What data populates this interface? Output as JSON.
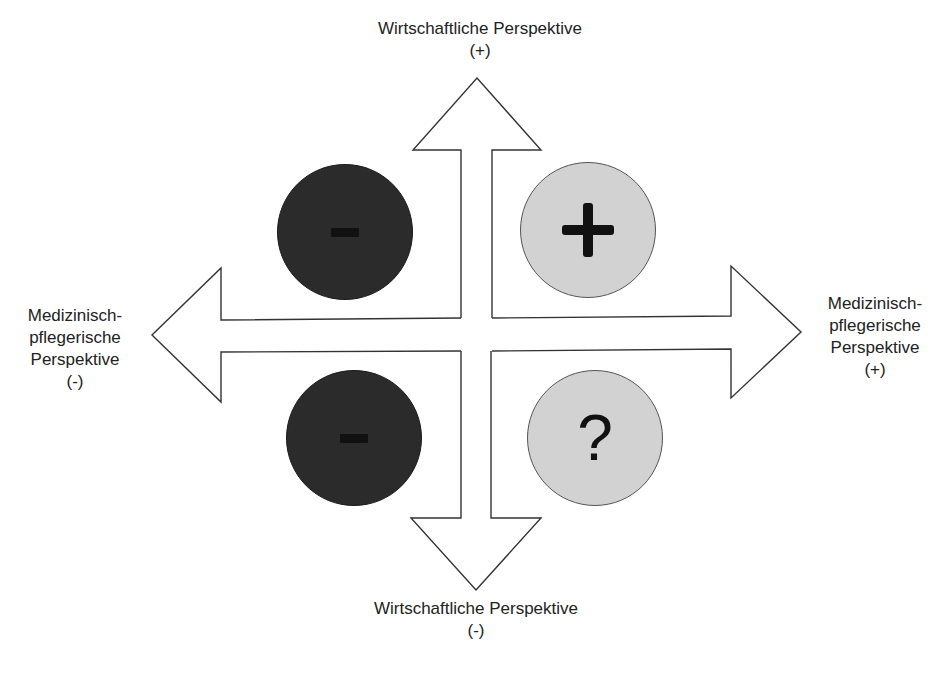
{
  "diagram": {
    "type": "four-direction-arrow-matrix",
    "axes": {
      "top": {
        "line1": "Wirtschaftliche Perspektive",
        "line2": "(+)"
      },
      "bottom": {
        "line1": "Wirtschaftliche Perspektive",
        "line2": "(-)"
      },
      "left": {
        "line1": "Medizinisch-",
        "line2": "pflegerische",
        "line3": "Perspektive",
        "line4": "(-)"
      },
      "right": {
        "line1": "Medizinisch-",
        "line2": "pflegerische",
        "line3": "Perspektive",
        "line4": "(+)"
      }
    },
    "quadrants": {
      "top_left": {
        "symbol": "-",
        "icon": "minus-icon",
        "fill": "#2b2b2b"
      },
      "top_right": {
        "symbol": "+",
        "icon": "plus-icon",
        "fill": "#d2d2d2"
      },
      "bottom_left": {
        "symbol": "-",
        "icon": "minus-icon",
        "fill": "#2b2b2b"
      },
      "bottom_right": {
        "symbol": "?",
        "icon": "question-icon",
        "fill": "#d2d2d2"
      }
    },
    "colors": {
      "stroke": "#333333",
      "arrow_fill": "#ffffff",
      "dark": "#2b2b2b",
      "light": "#d2d2d2"
    }
  }
}
